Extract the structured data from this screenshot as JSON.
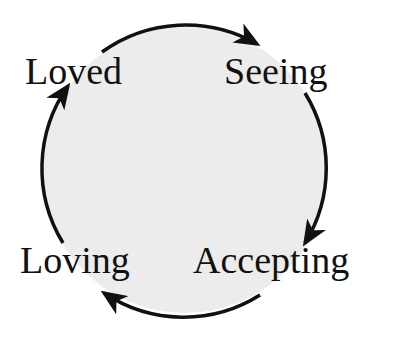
{
  "diagram": {
    "type": "cycle",
    "direction": "clockwise",
    "circle": {
      "fill": "#ececec",
      "stroke": "#111111"
    },
    "nodes": [
      {
        "id": "seeing",
        "label": "Seeing"
      },
      {
        "id": "accepting",
        "label": "Accepting"
      },
      {
        "id": "loving",
        "label": "Loving"
      },
      {
        "id": "loved",
        "label": "Loved"
      }
    ],
    "edges": [
      {
        "from": "Loved",
        "to": "Seeing"
      },
      {
        "from": "Seeing",
        "to": "Accepting"
      },
      {
        "from": "Accepting",
        "to": "Loving"
      },
      {
        "from": "Loving",
        "to": "Loved"
      }
    ]
  }
}
